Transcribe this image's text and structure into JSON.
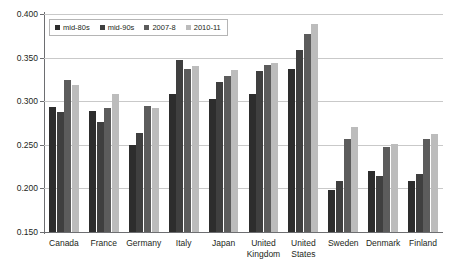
{
  "chart_data": {
    "type": "bar",
    "title": "",
    "xlabel": "",
    "ylabel": "",
    "ylim": [
      0.15,
      0.4
    ],
    "ytick_labels": [
      "0.400",
      "0.350",
      "0.300",
      "0.250",
      "0.200",
      "0.150"
    ],
    "ytick_values": [
      0.4,
      0.35,
      0.3,
      0.25,
      0.2,
      0.15
    ],
    "grid": true,
    "legend_position": "top-left",
    "categories": [
      "Canada",
      "France",
      "Germany",
      "Italy",
      "Japan",
      "United Kingdom",
      "United States",
      "Sweden",
      "Denmark",
      "Finland"
    ],
    "series": [
      {
        "name": "mid-80s",
        "color": "#2d2d2d",
        "values": [
          0.293,
          0.289,
          0.25,
          0.308,
          0.303,
          0.308,
          0.337,
          0.198,
          0.22,
          0.208
        ]
      },
      {
        "name": "mid-90s",
        "color": "#3f3f3f",
        "values": [
          0.288,
          0.276,
          0.264,
          0.347,
          0.322,
          0.335,
          0.359,
          0.209,
          0.214,
          0.216
        ]
      },
      {
        "name": "2007-8",
        "color": "#5c5c5c",
        "values": [
          0.324,
          0.292,
          0.295,
          0.337,
          0.329,
          0.341,
          0.377,
          0.257,
          0.247,
          0.257
        ]
      },
      {
        "name": "2010-11",
        "color": "#bcbcbc",
        "values": [
          0.319,
          0.308,
          0.292,
          0.34,
          0.336,
          0.344,
          0.388,
          0.271,
          0.251,
          0.262
        ]
      }
    ]
  },
  "legend": {
    "items": [
      {
        "label": "mid-80s"
      },
      {
        "label": "mid-90s"
      },
      {
        "label": "2007-8"
      },
      {
        "label": "2010-11"
      }
    ]
  },
  "axis": {
    "y_min_label": "0.150",
    "y_max_label": "0.400"
  }
}
